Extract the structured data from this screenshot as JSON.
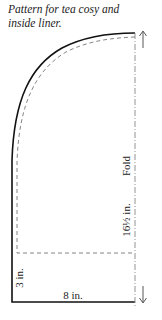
{
  "caption": {
    "line1": "Pattern for tea cosy and",
    "line2": "inside liner."
  },
  "labels": {
    "fold": "Fold",
    "height": "16½ in.",
    "side": "3 in.",
    "width": "8 in."
  },
  "arrows": {
    "top": "up-arrow",
    "bottom": "down-arrow"
  },
  "colors": {
    "outline": "#111111",
    "liner": "#777777",
    "fold": "#888888"
  }
}
